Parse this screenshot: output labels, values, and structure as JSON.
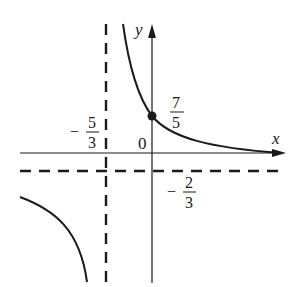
{
  "diagram": {
    "type": "function-graph",
    "axes": {
      "x_label": "x",
      "y_label": "y",
      "origin_label": "0"
    },
    "asymptotes": {
      "vertical": {
        "sign": "−",
        "num": "5",
        "den": "3"
      },
      "horizontal": {
        "sign": "−",
        "num": "2",
        "den": "3"
      }
    },
    "y_intercept": {
      "num": "7",
      "den": "5"
    },
    "colors": {
      "stroke": "#1a1a1a",
      "background": "#ffffff"
    }
  }
}
